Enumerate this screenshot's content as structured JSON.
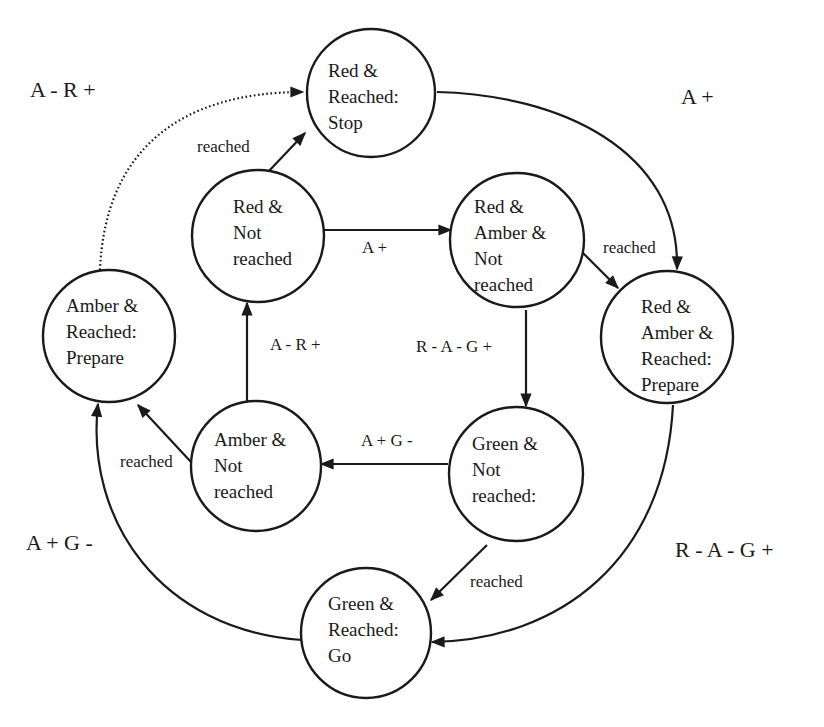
{
  "diagram": {
    "type": "state-transition",
    "nodes": [
      {
        "id": "red_reached",
        "lines": [
          "Red &",
          "Reached:",
          "Stop"
        ]
      },
      {
        "id": "red_not_reached",
        "lines": [
          "Red &",
          "Not",
          "reached"
        ]
      },
      {
        "id": "red_amber_not",
        "lines": [
          "Red &",
          "Amber &",
          "Not",
          "reached"
        ]
      },
      {
        "id": "red_amber_reached",
        "lines": [
          "Red &",
          "Amber &",
          "Reached:",
          "Prepare"
        ]
      },
      {
        "id": "amber_reached",
        "lines": [
          "Amber &",
          "Reached:",
          "Prepare"
        ]
      },
      {
        "id": "amber_not_reached",
        "lines": [
          "Amber &",
          "Not",
          "reached"
        ]
      },
      {
        "id": "green_not_reached",
        "lines": [
          "Green &",
          "Not",
          "reached:"
        ]
      },
      {
        "id": "green_reached",
        "lines": [
          "Green &",
          "Reached:",
          "Go"
        ]
      }
    ],
    "edge_labels": {
      "red_not_to_red_reached": "reached",
      "red_not_to_red_amber_not": "A +",
      "red_amber_not_to_red_amber_reached": "reached",
      "red_amber_not_to_green_not": "R -  A -  G +",
      "amber_not_to_red_not": "A -  R +",
      "green_not_to_amber_not": "A +  G -",
      "amber_not_to_amber_reached": "reached",
      "green_not_to_green_reached": "reached"
    },
    "outer_labels": {
      "amber_reached_to_red_reached": "A -  R +",
      "red_reached_to_red_amber_reached": "A +",
      "red_amber_reached_to_green_reached": "R -  A -  G +",
      "green_reached_to_amber_reached": "A +  G -"
    },
    "colors": {
      "stroke": "#1a1a1a",
      "background": "#ffffff"
    }
  }
}
